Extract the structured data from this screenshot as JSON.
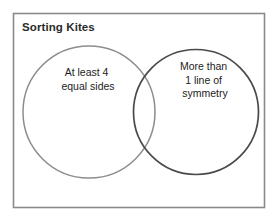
{
  "diagram": {
    "title": "Sorting Kites",
    "type": "venn-diagram",
    "background_color": "#ffffff",
    "frame_color": "#8a8a8a",
    "text_color": "#1c1c1c"
  },
  "sets": {
    "left": {
      "name": "at-least-4-equal-sides",
      "stroke_color": "#8d8d8d",
      "label_lines": [
        "At least 4",
        "equal sides"
      ],
      "line1": "At least 4",
      "line2": "equal sides"
    },
    "right": {
      "name": "more-than-1-line-of-symmetry",
      "stroke_color": "#4a4a4a",
      "label_lines": [
        "More than",
        "1 line of",
        "symmetry"
      ],
      "line1": "More than",
      "line2": "1 line of",
      "line3": "symmetry"
    }
  }
}
